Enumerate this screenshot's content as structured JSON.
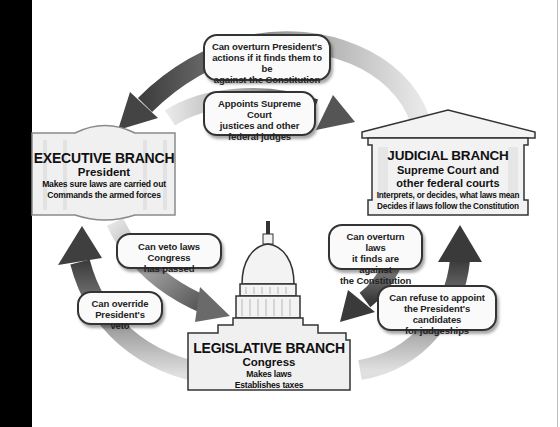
{
  "branches": {
    "executive": {
      "title": "EXECUTIVE BRANCH",
      "subtitle": "President",
      "duties": [
        "Makes sure laws are carried out",
        "Commands the armed forces"
      ]
    },
    "judicial": {
      "title": "JUDICIAL BRANCH",
      "subtitle_lines": [
        "Supreme Court and",
        "other federal courts"
      ],
      "duties": [
        "Interprets, or decides, what laws mean",
        "Decides if laws follow the Constitution"
      ]
    },
    "legislative": {
      "title": "LEGISLATIVE BRANCH",
      "subtitle": "Congress",
      "duties": [
        "Makes laws",
        "Establishes taxes"
      ]
    }
  },
  "checks": {
    "judicial_on_executive": [
      "Can overturn President's",
      "actions if it finds them to be",
      "against the Constitution"
    ],
    "executive_on_judicial": [
      "Appoints Supreme Court",
      "justices and other",
      "federal judges"
    ],
    "executive_on_legislative": [
      "Can veto laws Congress",
      "has passed"
    ],
    "legislative_on_executive": [
      "Can override",
      "President's veto"
    ],
    "judicial_on_legislative": [
      "Can overturn laws",
      "it finds are against",
      "the Constitution"
    ],
    "legislative_on_judicial": [
      "Can refuse to appoint",
      "the President's candidates",
      "for judgeships"
    ]
  },
  "colors": {
    "arrow_dark": "#4a4a4a",
    "arrow_light": "#d6d6d6",
    "box_fill": "#f2f2f2",
    "outline": "#333333"
  }
}
